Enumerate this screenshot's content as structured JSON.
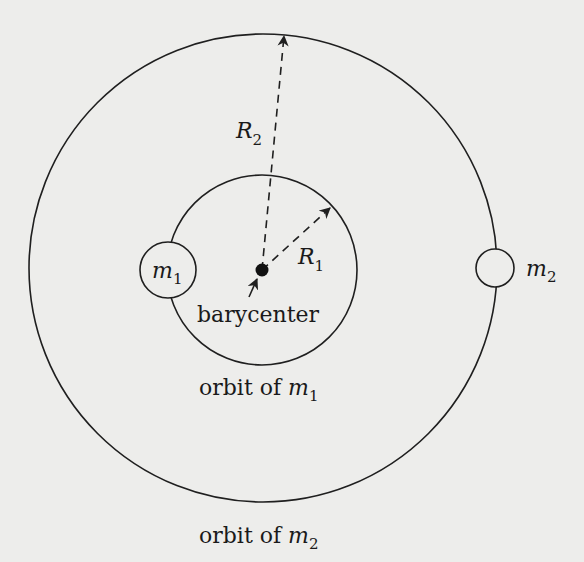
{
  "diagram": {
    "colors": {
      "background": "#ededeb",
      "stroke": "#1f1f1f"
    },
    "labels": {
      "barycenter": "barycenter",
      "orbit_m1_prefix": "orbit of ",
      "orbit_m2_prefix": "orbit of ",
      "m": "m",
      "R": "R",
      "sub1": "1",
      "sub2": "2"
    },
    "bodies": [
      {
        "name": "m1",
        "symbol": "m",
        "subscript": "1"
      },
      {
        "name": "m2",
        "symbol": "m",
        "subscript": "2"
      }
    ],
    "radii": [
      {
        "name": "R1",
        "symbol": "R",
        "subscript": "1"
      },
      {
        "name": "R2",
        "symbol": "R",
        "subscript": "2"
      }
    ]
  }
}
